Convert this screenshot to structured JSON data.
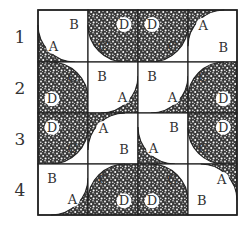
{
  "colors": {
    "line": "#222222",
    "shade_bg": "#3a3a3a",
    "shade_dot": "#ffffff",
    "white": "#ffffff",
    "label": "#333333",
    "badge": "#ffffff"
  },
  "grid": {
    "x0": 38,
    "y0": 10,
    "col_edges": [
      38,
      88,
      138,
      188,
      237
    ],
    "row_edges": [
      10,
      62,
      113,
      164,
      215
    ]
  },
  "row_labels": [
    {
      "text": "1",
      "y": 29
    },
    {
      "text": "2",
      "y": 80
    },
    {
      "text": "3",
      "y": 131
    },
    {
      "text": "4",
      "y": 182
    }
  ],
  "tiles": [
    [
      {
        "corner": "bl",
        "arc_shaded": true,
        "inside": "A",
        "outside": "B"
      },
      {
        "corner": "bl",
        "arc_shaded": false,
        "inside": "C",
        "outside": "D"
      },
      {
        "corner": "br",
        "arc_shaded": false,
        "inside": "C",
        "outside": "D"
      },
      {
        "corner": "tl",
        "arc_shaded": true,
        "inside": "A",
        "outside": "B"
      }
    ],
    [
      {
        "corner": "tr",
        "arc_shaded": false,
        "inside": "C",
        "outside": "D"
      },
      {
        "corner": "br",
        "arc_shaded": true,
        "inside": "A",
        "outside": "B"
      },
      {
        "corner": "br",
        "arc_shaded": true,
        "inside": "A",
        "outside": "B"
      },
      {
        "corner": "tl",
        "arc_shaded": false,
        "inside": "C",
        "outside": "D"
      }
    ],
    [
      {
        "corner": "br",
        "arc_shaded": false,
        "inside": "C",
        "outside": "D"
      },
      {
        "corner": "tl",
        "arc_shaded": true,
        "inside": "A",
        "outside": "B"
      },
      {
        "corner": "bl",
        "arc_shaded": true,
        "inside": "A",
        "outside": "B"
      },
      {
        "corner": "bl",
        "arc_shaded": false,
        "inside": "C",
        "outside": "D"
      }
    ],
    [
      {
        "corner": "br",
        "arc_shaded": true,
        "inside": "A",
        "outside": "B"
      },
      {
        "corner": "tl",
        "arc_shaded": false,
        "inside": "C",
        "outside": "D"
      },
      {
        "corner": "tr",
        "arc_shaded": false,
        "inside": "C",
        "outside": "D"
      },
      {
        "corner": "tr",
        "arc_shaded": true,
        "inside": "A",
        "outside": "B"
      }
    ]
  ],
  "legend_note": "4x4 grid of quarter-circle tiles labeled A, B, C, D"
}
